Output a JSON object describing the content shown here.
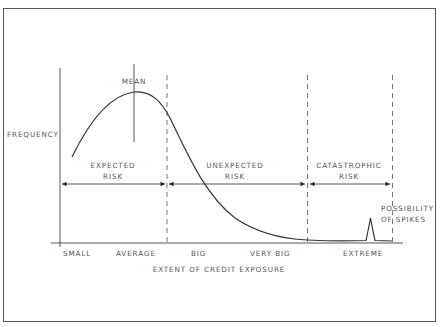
{
  "diagram": {
    "y_axis_label": "FREQUENCY",
    "x_axis_title": "EXTENT OF CREDIT EXPOSURE",
    "mean_label": "MEAN",
    "x_ticks": [
      "SMALL",
      "AVERAGE",
      "BIG",
      "VERY BIG",
      "EXTREME"
    ],
    "regions": [
      {
        "line1": "EXPECTED",
        "line2": "RISK"
      },
      {
        "line1": "UNEXPECTED",
        "line2": "RISK"
      },
      {
        "line1": "CATASTROPHIC",
        "line2": "RISK"
      }
    ],
    "spike_label": {
      "line1": "POSSIBILITY",
      "line2": "OF SPIKES"
    }
  }
}
